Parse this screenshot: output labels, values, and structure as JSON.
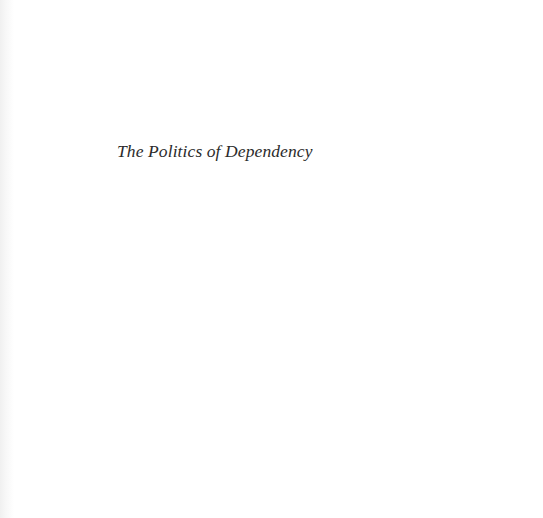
{
  "page": {
    "type": "half-title",
    "title": "The Politics of Dependency",
    "background_color": "#ffffff",
    "text_color": "#2b2b2b"
  }
}
